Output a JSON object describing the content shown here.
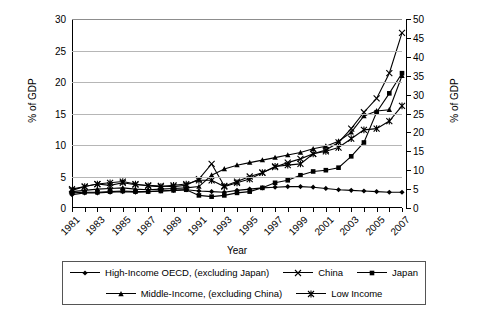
{
  "chart_data": {
    "type": "line",
    "title": "",
    "xlabel": "Year",
    "ylabel": "% of GDP",
    "ylabel_right": "% of GDP",
    "grid": true,
    "legend_position": "bottom",
    "ylim": [
      0,
      30
    ],
    "ylim_right": [
      0,
      50
    ],
    "yticks": [
      0,
      5,
      10,
      15,
      20,
      25,
      30
    ],
    "yticks_right": [
      0,
      5,
      10,
      15,
      20,
      25,
      30,
      35,
      40,
      45,
      50
    ],
    "x": [
      1981,
      1982,
      1983,
      1984,
      1985,
      1986,
      1987,
      1988,
      1989,
      1990,
      1991,
      1992,
      1993,
      1994,
      1995,
      1996,
      1997,
      1998,
      1999,
      2000,
      2001,
      2002,
      2003,
      2004,
      2005,
      2006,
      2007
    ],
    "xtick_labels": [
      "1981",
      "1983",
      "1985",
      "1987",
      "1989",
      "1991",
      "1993",
      "1995",
      "1997",
      "1999",
      "2001",
      "2003",
      "2005",
      "2007"
    ],
    "series": [
      {
        "name": "High-Income OECD, (excluding Japan)",
        "marker": "diamond",
        "axis": "left",
        "values": [
          2.1,
          2.4,
          2.4,
          2.5,
          2.6,
          2.5,
          2.6,
          2.7,
          2.8,
          2.9,
          2.7,
          2.6,
          2.5,
          2.8,
          3.0,
          3.2,
          3.3,
          3.4,
          3.4,
          3.3,
          3.1,
          2.9,
          2.8,
          2.7,
          2.6,
          2.5,
          2.5
        ]
      },
      {
        "name": "China",
        "marker": "cross",
        "axis": "left",
        "values": [
          3.0,
          3.4,
          3.8,
          3.6,
          4.0,
          3.7,
          3.6,
          3.5,
          3.4,
          3.6,
          4.6,
          7.0,
          3.5,
          4.2,
          5.0,
          5.6,
          6.5,
          7.2,
          7.8,
          8.6,
          9.2,
          10.4,
          12.6,
          15.2,
          17.4,
          21.4,
          27.8
        ]
      },
      {
        "name": "Japan",
        "marker": "square",
        "axis": "left",
        "values": [
          2.4,
          2.5,
          2.5,
          2.6,
          2.7,
          2.6,
          2.6,
          2.7,
          2.8,
          2.9,
          2.0,
          1.8,
          2.0,
          2.4,
          2.6,
          3.2,
          4.0,
          4.4,
          5.2,
          5.8,
          6.0,
          6.4,
          8.2,
          10.4,
          15.2,
          18.2,
          21.4
        ]
      },
      {
        "name": "Middle-Income, (excluding China)",
        "marker": "triangle",
        "axis": "left",
        "values": [
          2.6,
          2.8,
          3.0,
          3.1,
          3.2,
          3.0,
          2.9,
          3.0,
          3.1,
          3.2,
          3.4,
          5.2,
          6.2,
          6.8,
          7.2,
          7.6,
          8.0,
          8.4,
          8.8,
          9.4,
          9.8,
          10.6,
          12.0,
          14.6,
          15.4,
          15.6,
          21.0
        ]
      },
      {
        "name": "Low Income",
        "marker": "star",
        "axis": "left",
        "values": [
          2.8,
          3.4,
          3.8,
          4.0,
          4.2,
          3.8,
          3.5,
          3.4,
          3.6,
          3.8,
          4.4,
          4.4,
          3.4,
          4.0,
          4.6,
          5.6,
          6.6,
          6.8,
          7.0,
          8.6,
          9.0,
          9.6,
          11.0,
          12.4,
          12.6,
          13.8,
          16.2
        ]
      }
    ]
  },
  "legend": {
    "items": [
      {
        "label": "High-Income OECD, (excluding Japan)",
        "marker": "diamond"
      },
      {
        "label": "China",
        "marker": "cross"
      },
      {
        "label": "Japan",
        "marker": "square"
      },
      {
        "label": "Middle-Income, (excluding China)",
        "marker": "triangle"
      },
      {
        "label": "Low Income",
        "marker": "star"
      }
    ]
  },
  "colors": {
    "line": "#000000",
    "grid": "#b6b6b6",
    "axis": "#000000"
  }
}
